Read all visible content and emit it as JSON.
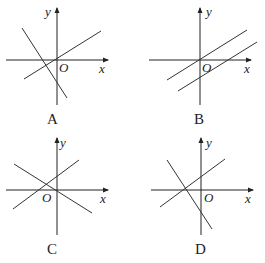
{
  "figure": {
    "panels": [
      {
        "id": "A",
        "caption": "A",
        "x_label": "x",
        "y_label": "y",
        "origin_label": "O",
        "description": "Two lines: one with positive slope through origin; one with negative slope crossing the x-axis left of origin and y-axis below origin"
      },
      {
        "id": "B",
        "caption": "B",
        "x_label": "x",
        "y_label": "y",
        "origin_label": "O",
        "description": "Two parallel lines with positive slope: one through origin, one crossing positive x-axis and negative y-axis"
      },
      {
        "id": "C",
        "caption": "C",
        "x_label": "x",
        "y_label": "y",
        "origin_label": "O",
        "description": "Two lines: one with negative slope through origin; one with positive slope crossing negative x-axis and positive y-axis"
      },
      {
        "id": "D",
        "caption": "D",
        "x_label": "x",
        "y_label": "y",
        "origin_label": "O",
        "description": "Two lines: one with positive slope crossing negative x-axis and positive y-axis; one with negative slope through the same x-intercept crossing negative y-axis"
      }
    ]
  }
}
